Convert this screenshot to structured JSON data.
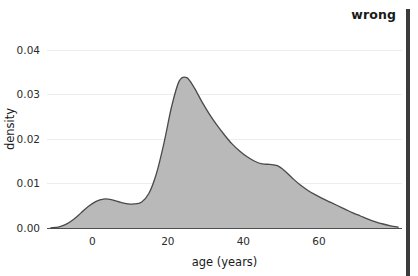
{
  "annotation": {
    "corner_label": "wrong",
    "bar_color": "#3b3b3b"
  },
  "chart_data": {
    "type": "area",
    "title": "",
    "subtitle": "",
    "xlabel": "age (years)",
    "ylabel": "density",
    "xlim": [
      -12,
      82
    ],
    "ylim": [
      0,
      0.0445
    ],
    "xticks": [
      0,
      20,
      40,
      60
    ],
    "xtick_labels": [
      "0",
      "20",
      "40",
      "60"
    ],
    "yticks": [
      0.0,
      0.01,
      0.02,
      0.03,
      0.04
    ],
    "ytick_labels": [
      "0.00",
      "0.01",
      "0.02",
      "0.03",
      "0.04"
    ],
    "grid": true,
    "legend": null,
    "fill_color": "#b9b9b9",
    "line_color": "#4a4a4a",
    "series": [
      {
        "name": "age density",
        "x": [
          -11,
          -9,
          -7,
          -5,
          -3,
          -1,
          1,
          3,
          5,
          7,
          9,
          11,
          13,
          15,
          17,
          19,
          21,
          23,
          25,
          27,
          29,
          31,
          33,
          35,
          37,
          39,
          41,
          43,
          45,
          47,
          49,
          51,
          53,
          55,
          57,
          59,
          61,
          63,
          65,
          67,
          69,
          71,
          73,
          75,
          77,
          79,
          81
        ],
        "y": [
          5e-05,
          0.0002,
          0.0008,
          0.0019,
          0.0034,
          0.0049,
          0.006,
          0.0065,
          0.0064,
          0.0059,
          0.0055,
          0.0054,
          0.0058,
          0.0078,
          0.0123,
          0.0192,
          0.0273,
          0.033,
          0.0338,
          0.0315,
          0.0284,
          0.0256,
          0.0231,
          0.0209,
          0.0189,
          0.0173,
          0.016,
          0.015,
          0.0144,
          0.0143,
          0.014,
          0.0128,
          0.0112,
          0.0097,
          0.0085,
          0.0075,
          0.0066,
          0.0058,
          0.005,
          0.0042,
          0.0034,
          0.0027,
          0.002,
          0.0014,
          0.0009,
          0.0005,
          0.0002
        ]
      }
    ]
  }
}
